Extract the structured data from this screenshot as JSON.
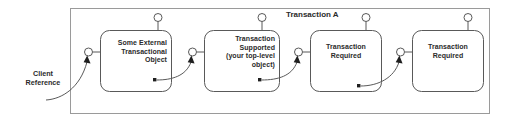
{
  "diagram": {
    "type": "uml-component-transaction-propagation",
    "container": {
      "title": "Transaction A",
      "x": 70,
      "y": 8,
      "w": 420,
      "h": 106,
      "border_color": "#9a9a9a",
      "fill_color": "#ffffff"
    },
    "external_label": {
      "name": "client-reference",
      "text": "Client\nReference",
      "x": 12,
      "y": 70,
      "w": 62
    },
    "components": [
      {
        "id": "some-external-transactional-object",
        "lines": [
          "Some External",
          "Transactional",
          "Object"
        ],
        "align": "right",
        "x": 100,
        "y": 30,
        "w": 72,
        "h": 62,
        "has_top_lollipop": true,
        "has_left_lollipop": true,
        "has_bottom_socket": true
      },
      {
        "id": "transaction-supported",
        "lines": [
          "Transaction",
          "Supported",
          "(your top-level",
          "object)"
        ],
        "align": "right",
        "x": 204,
        "y": 30,
        "w": 76,
        "h": 62,
        "has_top_lollipop": true,
        "has_left_lollipop": true,
        "has_bottom_socket": true
      },
      {
        "id": "transaction-required-1",
        "lines": [
          "Transaction",
          "Required"
        ],
        "align": "center",
        "x": 310,
        "y": 30,
        "w": 72,
        "h": 62,
        "has_top_lollipop": true,
        "has_left_lollipop": true,
        "has_bottom_socket": true
      },
      {
        "id": "transaction-required-2",
        "lines": [
          "Transaction",
          "Required"
        ],
        "align": "center",
        "x": 412,
        "y": 30,
        "w": 72,
        "h": 62,
        "has_top_lollipop": true,
        "has_left_lollipop": true,
        "has_bottom_socket": false
      }
    ],
    "connectors": [
      {
        "id": "client-to-box1",
        "from": "client-reference",
        "to": "some-external-transactional-object"
      },
      {
        "id": "box1-to-box2",
        "from": "some-external-transactional-object",
        "to": "transaction-supported"
      },
      {
        "id": "box2-to-box3",
        "from": "transaction-supported",
        "to": "transaction-required-1"
      },
      {
        "id": "box3-to-box4",
        "from": "transaction-required-1",
        "to": "transaction-required-2"
      }
    ],
    "colors": {
      "stroke": "#595959",
      "text": "#2b2b2b",
      "container_stroke": "#9a9a9a",
      "background": "#ffffff"
    }
  }
}
